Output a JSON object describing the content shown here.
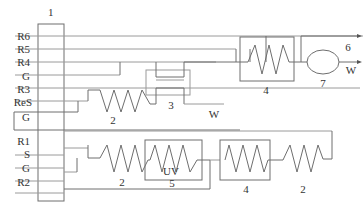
{
  "diagram": {
    "block_label": "1",
    "inputs_top": [
      "R6",
      "R5",
      "R4",
      "G",
      "R3",
      "ReS",
      "G"
    ],
    "inputs_bottom": [
      "R1",
      "S",
      "G",
      "R2"
    ],
    "components": {
      "coil_top": "2",
      "exchanger_3": "3",
      "coil_box_top": "4",
      "ellipse": "7",
      "coil_bottom_1": "2",
      "uv_box_label": "UV",
      "uv_box_number": "5",
      "coil_box_bottom": "4",
      "coil_bottom_2": "2"
    },
    "outputs": {
      "arrow_6": "6",
      "arrow_w_top": "W",
      "arrow_w_mid": "W"
    }
  }
}
